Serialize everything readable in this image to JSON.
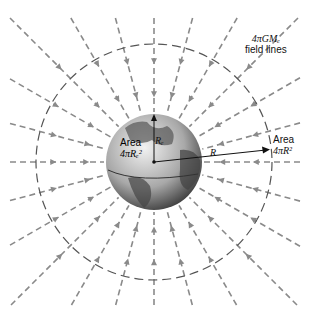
{
  "diagram": {
    "title_label": {
      "line1": "4πGMₑ",
      "line2": "field lines"
    },
    "earth_area_label": {
      "line1": "Area",
      "line2": "4πRₑ²"
    },
    "earth_radius_label": "Rₑ",
    "sphere_radius_label": "R",
    "sphere_area_label": {
      "line1": "Area",
      "line2": "4πR²"
    },
    "colors": {
      "field_line": "#8a8a8a",
      "sphere": "#555555",
      "globe_dark": "#333333",
      "globe_light": "#d8d8d8"
    }
  }
}
